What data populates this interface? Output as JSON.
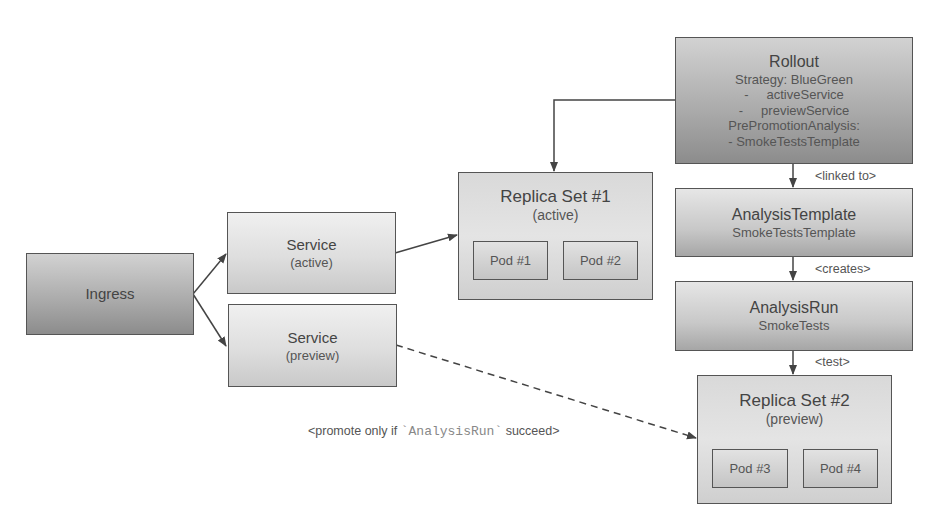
{
  "nodes": {
    "ingress": {
      "title": "Ingress"
    },
    "service_active": {
      "title": "Service",
      "subtitle": "(active)"
    },
    "service_preview": {
      "title": "Service",
      "subtitle": "(preview)"
    },
    "replica_set_1": {
      "title": "Replica Set #1",
      "subtitle": "(active)",
      "pods": [
        "Pod #1",
        "Pod #2"
      ]
    },
    "replica_set_2": {
      "title": "Replica Set #2",
      "subtitle": "(preview)",
      "pods": [
        "Pod #3",
        "Pod #4"
      ]
    },
    "rollout": {
      "title": "Rollout",
      "lines": [
        "Strategy: BlueGreen",
        "-     activeService",
        "-     previewService",
        "PrePromotionAnalysis:",
        "- SmokeTestsTemplate"
      ]
    },
    "analysis_template": {
      "title": "AnalysisTemplate",
      "subtitle": "SmokeTestsTemplate"
    },
    "analysis_run": {
      "title": "AnalysisRun",
      "subtitle": "SmokeTests"
    }
  },
  "edge_labels": {
    "linked_to": "<linked to>",
    "creates": "<creates>",
    "test": "<test>",
    "promote_prefix": "<promote only if ",
    "promote_code": "`AnalysisRun`",
    "promote_suffix": " succeed>"
  },
  "colors": {
    "line": "#444444",
    "dark_box": "#a9a9a9",
    "light_box": "#dedede"
  }
}
